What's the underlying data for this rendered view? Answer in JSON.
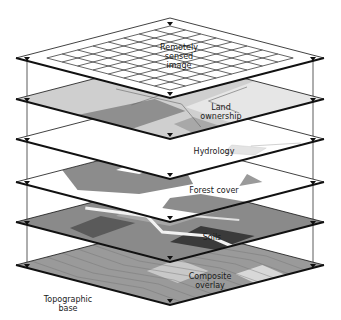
{
  "diagram": {
    "type": "gis-layer-stack",
    "layers": [
      {
        "id": "remotely-sensed",
        "label": "Remotely\nsensed\nimage",
        "fill": "#ffffff",
        "pattern": "grid"
      },
      {
        "id": "land-ownership",
        "label": "Land\nownership",
        "fill": "#cfcfcf",
        "pattern": "parcels"
      },
      {
        "id": "hydrology",
        "label": "Hydrology",
        "fill": "#ffffff",
        "pattern": "water"
      },
      {
        "id": "forest-cover",
        "label": "Forest cover",
        "fill": "#ffffff",
        "pattern": "forest"
      },
      {
        "id": "soils",
        "label": "Soils",
        "fill": "#8a8a8a",
        "pattern": "soils"
      },
      {
        "id": "composite-overlay",
        "label": "Composite\noverlay",
        "fill": "#9a9a9a",
        "pattern": "composite"
      }
    ],
    "base_label": "Topographic\nbase",
    "colors": {
      "edge": "#111111",
      "connector": "#333333",
      "light_gray": "#d8d8d8",
      "mid_gray": "#9c9c9c",
      "dark_gray": "#4a4a4a",
      "darkest": "#2a2a2a"
    }
  }
}
